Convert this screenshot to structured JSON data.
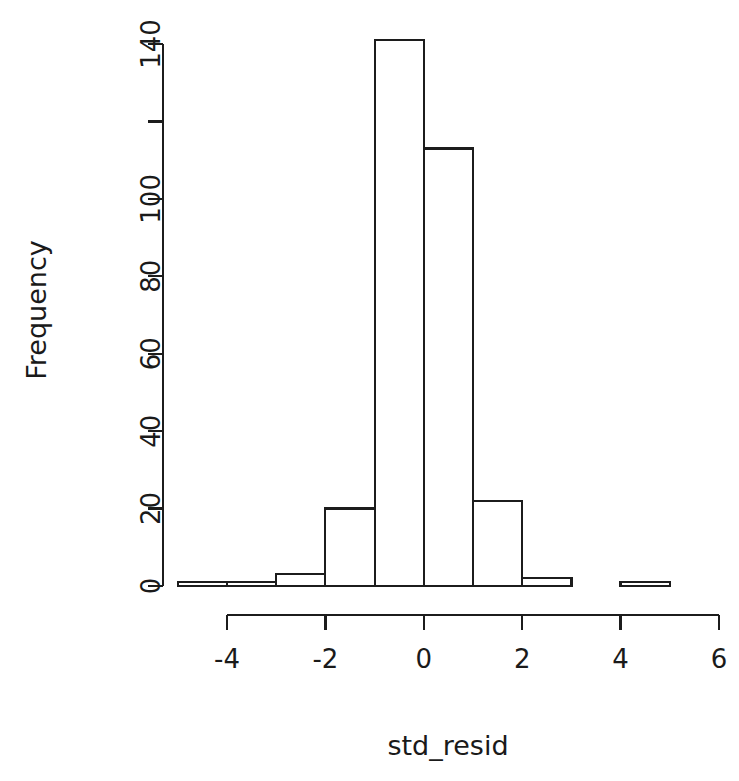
{
  "chart_data": {
    "type": "bar",
    "subtype": "histogram",
    "title": "",
    "subtitle": "",
    "xlabel": "std_resid",
    "ylabel": "Frequency",
    "bin_width": 1,
    "bin_edges": [
      -5,
      -4,
      -3,
      -2,
      -1,
      0,
      1,
      2,
      3,
      4,
      5,
      6
    ],
    "categories": [
      "-5 to -4",
      "-4 to -3",
      "-3 to -2",
      "-2 to -1",
      "-1 to 0",
      "0 to 1",
      "1 to 2",
      "2 to 3",
      "3 to 4",
      "4 to 5",
      "5 to 6"
    ],
    "values": [
      1,
      1,
      3,
      20,
      141,
      113,
      22,
      2,
      0,
      1,
      0
    ],
    "xlim": [
      -5,
      6
    ],
    "ylim": [
      0,
      141
    ],
    "x_ticks": [
      -4,
      -2,
      0,
      2,
      4,
      6
    ],
    "x_tick_labels": [
      "-4",
      "-2",
      "0",
      "2",
      "4",
      "6"
    ],
    "y_ticks": [
      0,
      20,
      40,
      60,
      80,
      100,
      120,
      140
    ],
    "y_tick_labels": [
      "0",
      "20",
      "40",
      "60",
      "80",
      "100",
      "",
      "140"
    ],
    "grid": false,
    "legend": false,
    "legend_position": "none",
    "bar_fill_color": "#ffffff",
    "bar_border_color": "#1c1c1c",
    "axis_color": "#1c1c1c",
    "background_color": "#ffffff"
  },
  "axis": {
    "y_label": "Frequency",
    "x_label": "std_resid"
  }
}
